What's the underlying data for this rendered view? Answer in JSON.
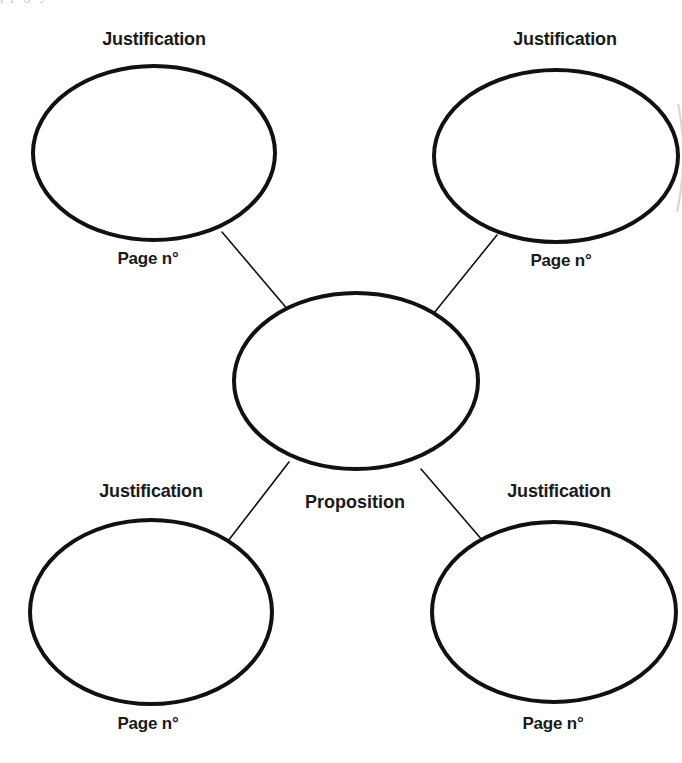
{
  "page": {
    "width": 682,
    "height": 763,
    "background_color": "#ffffff",
    "ink_color": "#111111",
    "top_bleed_text": "  p                               page                                         y"
  },
  "diagram": {
    "type": "concept-map",
    "center_node": {
      "id": "proposition",
      "label": "Proposition",
      "label_position": "below",
      "shape": "ellipse",
      "fill": "#ffffff",
      "stroke": "#111111",
      "stroke_width": 4,
      "cx": 356,
      "cy": 381,
      "rx": 122,
      "ry": 88,
      "label_x": 355,
      "label_y": 492
    },
    "nodes": [
      {
        "id": "justification-top-left",
        "title": "Justification",
        "page_label": "Page n°",
        "shape": "ellipse",
        "fill": "#ffffff",
        "stroke": "#111111",
        "stroke_width": 4,
        "cx": 154,
        "cy": 153,
        "rx": 121,
        "ry": 87,
        "title_x": 154,
        "title_y": 29,
        "page_x": 148,
        "page_y": 249
      },
      {
        "id": "justification-top-right",
        "title": "Justification",
        "page_label": "Page n°",
        "shape": "ellipse",
        "fill": "#ffffff",
        "stroke": "#111111",
        "stroke_width": 4,
        "cx": 556,
        "cy": 156,
        "rx": 122,
        "ry": 86,
        "title_x": 565,
        "title_y": 29,
        "page_x": 561,
        "page_y": 251
      },
      {
        "id": "justification-bottom-left",
        "title": "Justification",
        "page_label": "Page n°",
        "shape": "ellipse",
        "fill": "#ffffff",
        "stroke": "#111111",
        "stroke_width": 4,
        "cx": 151,
        "cy": 612,
        "rx": 121,
        "ry": 92,
        "title_x": 151,
        "title_y": 481,
        "page_x": 148,
        "page_y": 714
      },
      {
        "id": "justification-bottom-right",
        "title": "Justification",
        "page_label": "Page n°",
        "shape": "ellipse",
        "fill": "#ffffff",
        "stroke": "#111111",
        "stroke_width": 4,
        "cx": 554,
        "cy": 612,
        "rx": 122,
        "ry": 90,
        "title_x": 559,
        "title_y": 481,
        "page_x": 553,
        "page_y": 714
      }
    ],
    "connectors": [
      {
        "id": "connector-top-left",
        "from": "proposition",
        "to": "justification-top-left",
        "x1": 289,
        "y1": 311,
        "x2": 222,
        "y2": 232,
        "stroke": "#111111",
        "stroke_width": 1.6
      },
      {
        "id": "connector-top-right",
        "from": "proposition",
        "to": "justification-top-right",
        "x1": 434,
        "y1": 313,
        "x2": 497,
        "y2": 235,
        "stroke": "#111111",
        "stroke_width": 1.6
      },
      {
        "id": "connector-bottom-left",
        "from": "proposition",
        "to": "justification-bottom-left",
        "x1": 289,
        "y1": 462,
        "x2": 228,
        "y2": 541,
        "stroke": "#111111",
        "stroke_width": 1.6
      },
      {
        "id": "connector-bottom-right",
        "from": "proposition",
        "to": "justification-bottom-right",
        "x1": 421,
        "y1": 469,
        "x2": 483,
        "y2": 541,
        "stroke": "#111111",
        "stroke_width": 1.6
      }
    ],
    "artifacts": [
      {
        "id": "right-edge-scan-artifact",
        "description": "Faint grey arc fragment from the scanned page gutter at the right edge",
        "color": "#c9c9cc"
      }
    ]
  }
}
